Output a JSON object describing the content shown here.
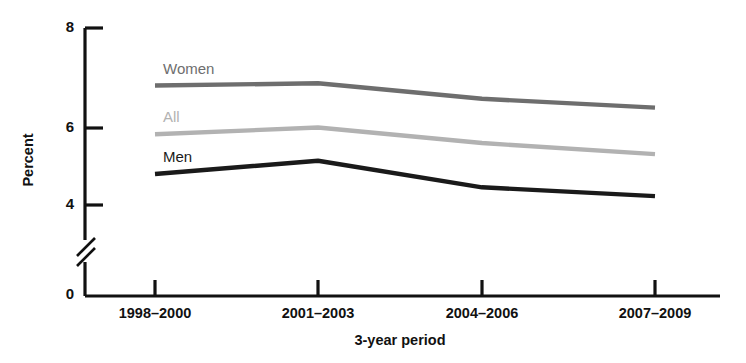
{
  "chart_data": {
    "type": "line",
    "title": "",
    "xlabel": "3-year period",
    "ylabel": "Percent",
    "categories": [
      "1998–2000",
      "2001–2003",
      "2004–2006",
      "2007–2009"
    ],
    "yticks": [
      "0",
      "4",
      "6",
      "8"
    ],
    "ytick_values": [
      0,
      4,
      6,
      8
    ],
    "ylim": [
      3.6,
      8
    ],
    "axis_break": true,
    "axis_break_note": "y-axis broken between 0 and 4",
    "grid": false,
    "legend_position": "inline-left",
    "series": [
      {
        "name": "Women",
        "label": "Women",
        "color": "#6e6e6e",
        "values": [
          6.7,
          6.75,
          6.4,
          6.2
        ]
      },
      {
        "name": "All",
        "label": "All",
        "color": "#b2b2b2",
        "values": [
          5.6,
          5.75,
          5.4,
          5.15
        ]
      },
      {
        "name": "Men",
        "label": "Men",
        "color": "#1a1a1a",
        "values": [
          4.7,
          5.0,
          4.4,
          4.2
        ]
      }
    ]
  },
  "labels": {
    "y_axis_title": "Percent",
    "x_axis_title": "3-year period",
    "ytick_8": "8",
    "ytick_6": "6",
    "ytick_4": "4",
    "ytick_0": "0",
    "xtick_1": "1998–2000",
    "xtick_2": "2001–2003",
    "xtick_3": "2004–2006",
    "xtick_4": "2007–2009",
    "series_women": "Women",
    "series_all": "All",
    "series_men": "Men"
  }
}
